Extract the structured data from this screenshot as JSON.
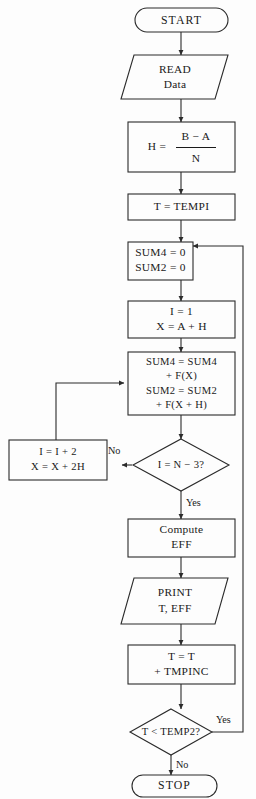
{
  "diagram": {
    "background_color": "#fdfdfd",
    "line_color": "#2b2b2b",
    "text_color": "#1a1a1a"
  },
  "nodes": {
    "start": {
      "kind": "terminator",
      "label": "START"
    },
    "read_data": {
      "kind": "input-output",
      "line1": "READ",
      "line2": "Data"
    },
    "compute_h": {
      "kind": "process",
      "lhs": "H  =",
      "numerator": "B − A",
      "denominator": "N"
    },
    "set_t": {
      "kind": "process",
      "line1": "T  =  TEMPI"
    },
    "init_sums": {
      "kind": "process",
      "line1": "SUM4  =  0",
      "line2": "SUM2  =  0"
    },
    "init_loop": {
      "kind": "process",
      "line1": "I  =  1",
      "line2": "X  =  A  +  H"
    },
    "accumulate": {
      "kind": "process",
      "line1": "SUM4  =  SUM4",
      "line2": "+  F(X)",
      "line3": "SUM2  =  SUM2",
      "line4": "+  F(X  +  H)"
    },
    "loop_test": {
      "kind": "decision",
      "label": "I  =  N  −  3?",
      "yes_label": "Yes",
      "no_label": "No"
    },
    "increment": {
      "kind": "process",
      "line1": "I  =  I  +  2",
      "line2": "X  =  X  +  2H"
    },
    "compute_eff": {
      "kind": "process",
      "line1": "Compute",
      "line2": "EFF"
    },
    "print_results": {
      "kind": "input-output",
      "line1": "PRINT",
      "line2": "T,  EFF"
    },
    "increment_t": {
      "kind": "process",
      "line1": "T  =  T",
      "line2": "+  TMPINC"
    },
    "temp_test": {
      "kind": "decision",
      "label": "T  <  TEMP2?",
      "yes_label": "Yes",
      "no_label": "No"
    },
    "stop": {
      "kind": "terminator",
      "label": "STOP"
    }
  }
}
